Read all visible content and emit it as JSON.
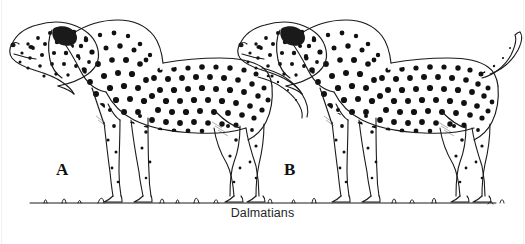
{
  "figure": {
    "caption": "Dalmatians",
    "background_color": "#ffffff",
    "ink_color": "#1a1a1a",
    "spot_color": "#111111",
    "caption_color": "#262626",
    "width": 525,
    "height": 244,
    "style": "black-and-white line drawing"
  },
  "labels": {
    "a": "A",
    "b": "B"
  },
  "dogs": [
    {
      "id": "dog-a",
      "label": "A",
      "facing": "left",
      "tail": "low sweeping tail angled down and to the right",
      "pose": "standing square on ground line"
    },
    {
      "id": "dog-b",
      "label": "B",
      "facing": "left",
      "tail": "raised tail curving up and to the right",
      "pose": "standing square on ground line"
    }
  ],
  "ground": {
    "name": "ground-line",
    "description": "horizontal ground line with small grass tufts"
  }
}
